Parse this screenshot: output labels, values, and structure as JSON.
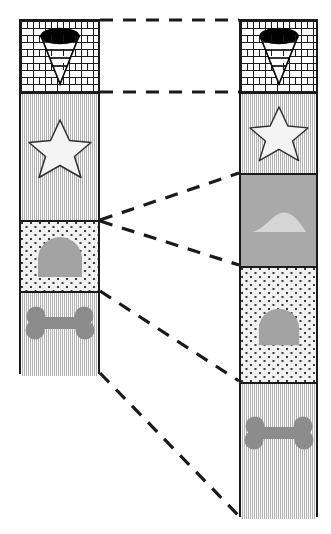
{
  "figure": {
    "type": "stratigraphic-correlation-diagram",
    "background_color": "#ffffff",
    "line_color": "#1a1a1a",
    "canvas": {
      "width": 331,
      "height": 534
    }
  },
  "palette": {
    "outline": "#1a1a1a",
    "brick_fill": "#ffffff",
    "lined_fill": "#d4d4d4",
    "dotted_fill": "#f2f2f2",
    "solid_gray_fill": "#a9a9a9",
    "fossil_gray": "#8c8c8c",
    "fossil_light": "#d9d9d9",
    "star_fill": "#f4f4f4",
    "tornado_dark": "#000000",
    "tornado_light": "#ffffff"
  },
  "columns": [
    {
      "id": "left-column",
      "name": "left-stratigraphic-column",
      "x": 19,
      "y": 19,
      "width": 81,
      "height": 355,
      "units": [
        {
          "id": "L1",
          "label": "unit-brick-tornado",
          "pattern": "brick",
          "symbol": "tornado-icon",
          "top": 0,
          "height": 73
        },
        {
          "id": "L2",
          "label": "unit-lined-star",
          "pattern": "lined",
          "symbol": "star-icon",
          "top": 73,
          "height": 128
        },
        {
          "id": "L3",
          "label": "unit-dotted-dome",
          "pattern": "dotted",
          "symbol": "dome-icon",
          "top": 201,
          "height": 71
        },
        {
          "id": "L4",
          "label": "unit-lined-bone",
          "pattern": "lined",
          "symbol": "bone-icon",
          "top": 272,
          "height": 83
        }
      ]
    },
    {
      "id": "right-column",
      "name": "right-stratigraphic-column",
      "x": 239,
      "y": 19,
      "width": 79,
      "height": 498,
      "units": [
        {
          "id": "R1",
          "label": "unit-brick-tornado",
          "pattern": "brick",
          "symbol": "tornado-icon",
          "top": 0,
          "height": 73
        },
        {
          "id": "R2",
          "label": "unit-lined-star",
          "pattern": "lined",
          "symbol": "star-icon",
          "top": 73,
          "height": 81
        },
        {
          "id": "R3",
          "label": "unit-solid-hill",
          "pattern": "solid",
          "symbol": "hill-icon",
          "top": 154,
          "height": 93
        },
        {
          "id": "R4",
          "label": "unit-dotted-dome",
          "pattern": "dotted",
          "symbol": "dome-icon",
          "top": 247,
          "height": 116
        },
        {
          "id": "R5",
          "label": "unit-lined-bone",
          "pattern": "lined",
          "symbol": "bone-icon",
          "top": 363,
          "height": 135
        }
      ]
    }
  ],
  "correlation_lines": [
    {
      "id": "C1",
      "name": "correlation-line-top",
      "x1": 100,
      "y1": 20,
      "x2": 239,
      "y2": 20
    },
    {
      "id": "C2",
      "name": "correlation-line-brick-base",
      "x1": 100,
      "y1": 92,
      "x2": 239,
      "y2": 92
    },
    {
      "id": "C3",
      "name": "correlation-line-star-base-up",
      "x1": 100,
      "y1": 220,
      "x2": 239,
      "y2": 173
    },
    {
      "id": "C4",
      "name": "correlation-line-star-base-dn",
      "x1": 100,
      "y1": 221,
      "x2": 239,
      "y2": 265
    },
    {
      "id": "C5",
      "name": "correlation-line-dome-base",
      "x1": 100,
      "y1": 291,
      "x2": 239,
      "y2": 381
    },
    {
      "id": "C6",
      "name": "correlation-line-section-base",
      "x1": 100,
      "y1": 373,
      "x2": 239,
      "y2": 516
    }
  ],
  "symbols_legend": [
    {
      "name": "tornado-icon",
      "description": "inverted cone / funnel with banded rings and dark elliptical top"
    },
    {
      "name": "star-icon",
      "description": "five-pointed star outline, light fill"
    },
    {
      "name": "dome-icon",
      "description": "gray rounded dome / arch"
    },
    {
      "name": "bone-icon",
      "description": "gray dog-bone shape"
    },
    {
      "name": "hill-icon",
      "description": "light gray low mound / hill"
    }
  ]
}
